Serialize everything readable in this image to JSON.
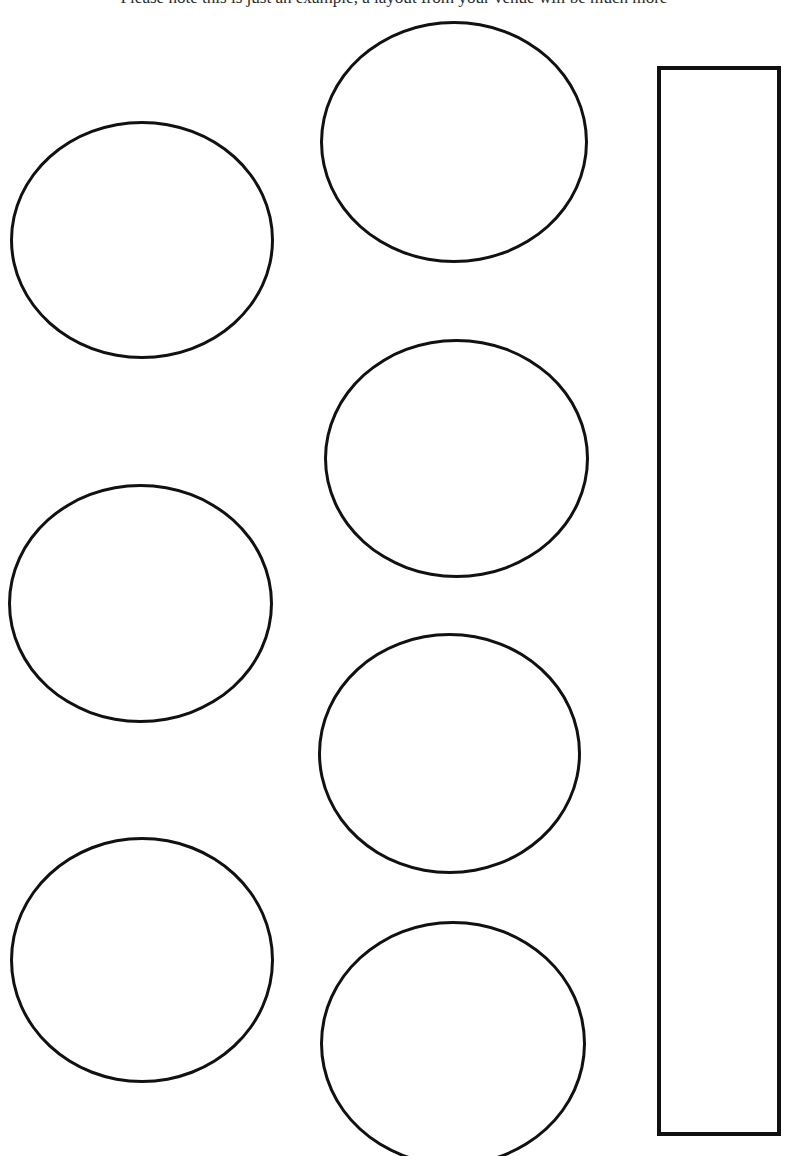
{
  "page": {
    "note": "Please note this is just an example, a layout from your venue will be much more",
    "width": 788,
    "height": 1156,
    "background_color": "#ffffff",
    "ink_color": "#111111"
  },
  "diagram_data": {
    "type": "floor-plan",
    "title": "Venue table layout example",
    "units": "px",
    "shapes": [
      {
        "id": "table-l1",
        "name": "round-table-left-1",
        "shape": "circle",
        "column": "left",
        "index": 1,
        "x": 10,
        "y": 121,
        "width": 264,
        "height": 238,
        "stroke": "#111111",
        "stroke_width": 3,
        "fill": "#ffffff",
        "clipped": false
      },
      {
        "id": "table-l2",
        "name": "round-table-left-2",
        "shape": "circle",
        "column": "left",
        "index": 2,
        "x": 8,
        "y": 484,
        "width": 265,
        "height": 239,
        "stroke": "#111111",
        "stroke_width": 3,
        "fill": "#ffffff",
        "clipped": false
      },
      {
        "id": "table-l3",
        "name": "round-table-left-3",
        "shape": "circle",
        "column": "left",
        "index": 3,
        "x": 10,
        "y": 837,
        "width": 264,
        "height": 246,
        "stroke": "#111111",
        "stroke_width": 3,
        "fill": "#ffffff",
        "clipped": false
      },
      {
        "id": "table-m1",
        "name": "round-table-middle-1",
        "shape": "circle",
        "column": "middle",
        "index": 1,
        "x": 320,
        "y": 21,
        "width": 268,
        "height": 242,
        "stroke": "#111111",
        "stroke_width": 3,
        "fill": "#ffffff",
        "clipped": false
      },
      {
        "id": "table-m2",
        "name": "round-table-middle-2",
        "shape": "circle",
        "column": "middle",
        "index": 2,
        "x": 324,
        "y": 339,
        "width": 265,
        "height": 239,
        "stroke": "#111111",
        "stroke_width": 3,
        "fill": "#ffffff",
        "clipped": false
      },
      {
        "id": "table-m3",
        "name": "round-table-middle-3",
        "shape": "circle",
        "column": "middle",
        "index": 3,
        "x": 318,
        "y": 633,
        "width": 263,
        "height": 241,
        "stroke": "#111111",
        "stroke_width": 3,
        "fill": "#ffffff",
        "clipped": false
      },
      {
        "id": "table-m4",
        "name": "round-table-middle-4",
        "shape": "circle",
        "column": "middle",
        "index": 4,
        "x": 320,
        "y": 921,
        "width": 266,
        "height": 245,
        "stroke": "#111111",
        "stroke_width": 3,
        "fill": "#ffffff",
        "clipped": true
      },
      {
        "id": "table-r1",
        "name": "rectangular-table-right",
        "shape": "rectangle",
        "column": "right",
        "index": 1,
        "x": 657,
        "y": 66,
        "width": 124,
        "height": 1070,
        "stroke": "#111111",
        "stroke_width": 4,
        "fill": "#ffffff",
        "clipped": false
      }
    ],
    "counts": {
      "round_tables": 7,
      "rectangular_tables": 1,
      "total_shapes": 8
    }
  }
}
